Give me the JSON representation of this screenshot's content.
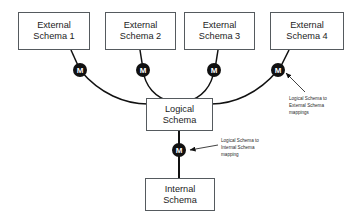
{
  "diagram": {
    "type": "three-schema-architecture",
    "background_color": "#ffffff",
    "box_border_color": "#555a5e",
    "line_color": "#111111",
    "node_fill_color": "#111111",
    "node_text_color": "#ffffff"
  },
  "external_schemas": [
    {
      "line1": "External",
      "line2": "Schema 1"
    },
    {
      "line1": "External",
      "line2": "Schema 2"
    },
    {
      "line1": "External",
      "line2": "Schema 3"
    },
    {
      "line1": "External",
      "line2": "Schema 4"
    }
  ],
  "logical_schema": {
    "line1": "Logical",
    "line2": "Schema"
  },
  "internal_schema": {
    "line1": "Internal",
    "line2": "Schema"
  },
  "mapping_nodes": {
    "label": "M",
    "external": [
      {
        "label": "M"
      },
      {
        "label": "M"
      },
      {
        "label": "M"
      },
      {
        "label": "M"
      }
    ],
    "internal": {
      "label": "M"
    }
  },
  "annotations": {
    "external_mapping": {
      "line1": "Logical Schema to",
      "line2": "External Schema",
      "line3": "mappings"
    },
    "internal_mapping": {
      "line1": "Logical Schema to",
      "line2": "Internal Schema",
      "line3": "mapping"
    }
  }
}
